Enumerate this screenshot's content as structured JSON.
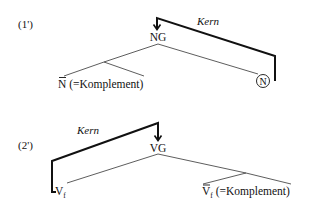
{
  "diagrams": [
    {
      "id": "1'",
      "label": "(1')",
      "head_label": "Kern",
      "root": "NG",
      "complement": {
        "category": "N",
        "annotation": "(=Komplement)",
        "bar": true
      },
      "head": {
        "category": "N",
        "circled": true
      }
    },
    {
      "id": "2'",
      "label": "(2')",
      "head_label": "Kern",
      "root": "VG",
      "head": {
        "category": "V",
        "subscript": "f"
      },
      "complement": {
        "category": "V",
        "subscript": "f",
        "annotation": "(=Komplement)",
        "bar": true
      }
    }
  ],
  "colors": {
    "line": "#111111",
    "thin_line": "#333333",
    "background": "#ffffff"
  }
}
